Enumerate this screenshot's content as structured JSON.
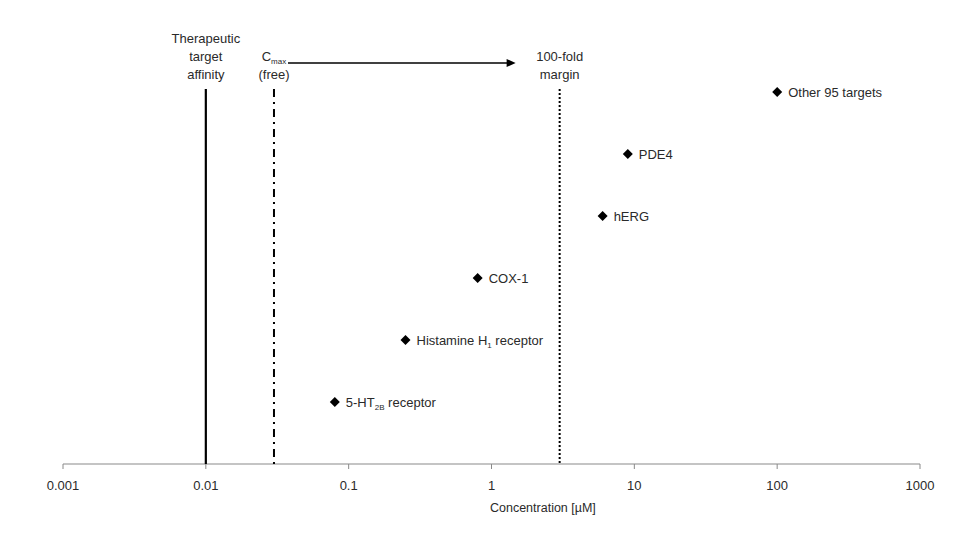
{
  "chart_data": {
    "type": "scatter",
    "title": "",
    "xlabel": "Concentration [µM]",
    "ylabel": "",
    "xscale": "log",
    "xlim": [
      0.001,
      1000
    ],
    "xticks": [
      0.001,
      0.01,
      0.1,
      1,
      10,
      100,
      1000
    ],
    "xtick_labels": [
      "0.001",
      "0.01",
      "0.1",
      "1",
      "10",
      "100",
      "1000"
    ],
    "grid": false,
    "legend": null,
    "marker": "diamond",
    "marker_color": "#000000",
    "points": [
      {
        "name": "5-HT2B receptor",
        "label_main": "5-HT",
        "label_sub": "2B",
        "label_tail": " receptor",
        "x": 0.08,
        "rank": 1
      },
      {
        "name": "Histamine H1 receptor",
        "label_main": "Histamine H",
        "label_sub": "1",
        "label_tail": " receptor",
        "x": 0.25,
        "rank": 2
      },
      {
        "name": "COX-1",
        "label_main": "COX-1",
        "label_sub": "",
        "label_tail": "",
        "x": 0.8,
        "rank": 3
      },
      {
        "name": "hERG",
        "label_main": "hERG",
        "label_sub": "",
        "label_tail": "",
        "x": 6,
        "rank": 4
      },
      {
        "name": "PDE4",
        "label_main": "PDE4",
        "label_sub": "",
        "label_tail": "",
        "x": 9,
        "rank": 5
      },
      {
        "name": "Other 95 targets",
        "label_main": "Other 95 targets",
        "label_sub": "",
        "label_tail": "",
        "x": 100,
        "rank": 6
      }
    ],
    "reference_lines": [
      {
        "name": "therapeutic-target-affinity",
        "x": 0.01,
        "style": "solid",
        "label_lines": [
          "Therapeutic",
          "target",
          "affinity"
        ]
      },
      {
        "name": "cmax-free",
        "x": 0.03,
        "style": "dashdot",
        "label_main": "C",
        "label_sub": "max",
        "label_line2": "(free)"
      },
      {
        "name": "100-fold-margin",
        "x": 3,
        "style": "dotted",
        "label_lines": [
          "100-fold",
          "margin"
        ]
      }
    ],
    "annotations": [
      {
        "type": "arrow",
        "from_x": 0.03,
        "to_x": 3,
        "text": ""
      }
    ]
  }
}
